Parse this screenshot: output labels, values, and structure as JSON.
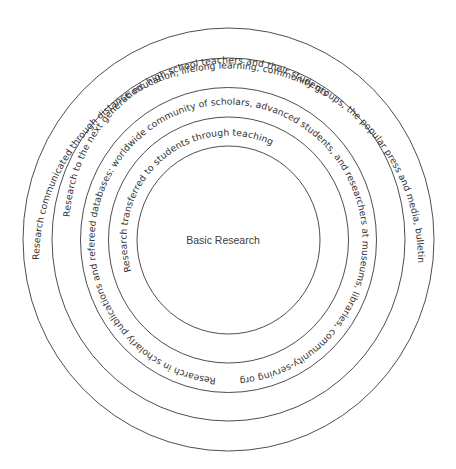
{
  "diagram": {
    "center_label": "Basic Research",
    "rings": [
      {
        "level": 1,
        "label": "Research transferred to students through teaching"
      },
      {
        "level": 2,
        "label": "Research in scholarly publications and refereed databases: worldwide community of scholars, advanced students, and researchers at museums, libraries, community-serving organizations, etc."
      },
      {
        "level": 3,
        "label": "Research to the next generation: high school teachers and their students"
      },
      {
        "level": 4,
        "label": "Research communicated through distance education, lifelong learning, community groups, the popular press and media, bulletin boards, web sites"
      }
    ],
    "colors": {
      "line": "#3a3a3a",
      "text": "#333333",
      "background": "#ffffff"
    }
  }
}
